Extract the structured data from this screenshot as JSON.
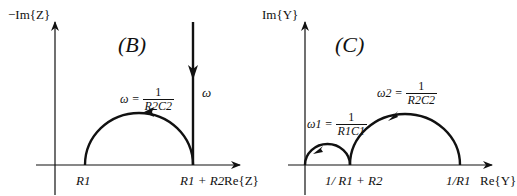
{
  "panel_b": {
    "tag": "(B)",
    "y_axis_label": "−Im{Z}",
    "x_axis_label": "Re{Z}",
    "tick_r1": "R1",
    "tick_r1r2": "R1 + R2",
    "omega_eq_lhs": "ω =",
    "omega_eq_num": "1",
    "omega_eq_den": "R2C2",
    "omega_vertical": "ω"
  },
  "panel_c": {
    "tag": "(C)",
    "y_axis_label": "Im{Y}",
    "x_axis_label": "Re{Y}",
    "tick_mid": "1/ R1 + R2",
    "tick_end": "1/R1",
    "omega1_lhs": "ω1 =",
    "omega1_num": "1",
    "omega1_den": "R1C1",
    "omega2_lhs": "ω2 =",
    "omega2_num": "1",
    "omega2_den": "R2C2"
  }
}
